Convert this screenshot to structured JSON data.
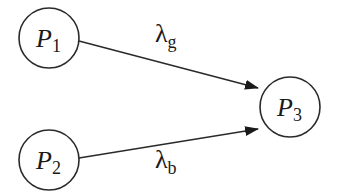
{
  "diagram": {
    "nodes": [
      {
        "id": "P1",
        "label": "P",
        "subscript": "1",
        "cx": 49,
        "cy": 38,
        "r": 30
      },
      {
        "id": "P2",
        "label": "P",
        "subscript": "2",
        "cx": 49,
        "cy": 160,
        "r": 30
      },
      {
        "id": "P3",
        "label": "P",
        "subscript": "3",
        "cx": 290,
        "cy": 107,
        "r": 30
      }
    ],
    "edges": [
      {
        "from": "P1",
        "to": "P3",
        "label": "λ",
        "subscript": "g"
      },
      {
        "from": "P2",
        "to": "P3",
        "label": "λ",
        "subscript": "b"
      }
    ],
    "colors": {
      "stroke": "#2a2a2a",
      "background": "#ffffff"
    }
  }
}
